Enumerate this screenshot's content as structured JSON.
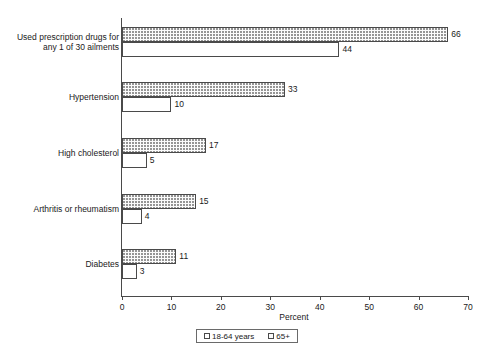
{
  "chart_data": {
    "type": "bar",
    "orientation": "horizontal",
    "title": "",
    "xlabel": "Percent",
    "ylabel": "",
    "xlim": [
      0,
      70
    ],
    "xticks": [
      0,
      10,
      20,
      30,
      40,
      50,
      60,
      70
    ],
    "grid": false,
    "legend_position": "bottom-center",
    "categories": [
      "Used prescription drugs for any 1 of 30 ailments",
      "Hypertension",
      "High cholesterol",
      "Arthritis or rheumatism",
      "Diabetes"
    ],
    "category_lines": [
      [
        "Used prescription drugs for",
        "any 1 of 30 ailments"
      ],
      [
        "Hypertension"
      ],
      [
        "High cholesterol"
      ],
      [
        "Arthritis or rheumatism"
      ],
      [
        "Diabetes"
      ]
    ],
    "series": [
      {
        "name": "65+",
        "pattern": "dotted",
        "values": [
          66,
          33,
          17,
          15,
          11
        ]
      },
      {
        "name": "18-64 years",
        "pattern": "plain",
        "values": [
          44,
          10,
          5,
          4,
          3
        ]
      }
    ]
  },
  "legend": {
    "items": [
      {
        "label": "18-64 years",
        "pattern": "plain"
      },
      {
        "label": "65+",
        "pattern": "dotted"
      }
    ]
  },
  "axis": {
    "x_title": "Percent"
  }
}
